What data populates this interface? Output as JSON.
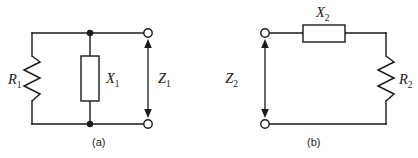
{
  "figure": {
    "background_color": "#ffffff",
    "line_color": "#1a1a1a",
    "width": 418,
    "height": 158
  },
  "circuit_a": {
    "caption": "(a)",
    "topology": "parallel",
    "components": [
      {
        "id": "r1",
        "label_base": "R",
        "label_sub": "1",
        "symbol": "zigzag-resistor",
        "orientation": "vertical",
        "label_side": "left"
      },
      {
        "id": "x1",
        "label_base": "X",
        "label_sub": "1",
        "symbol": "box-reactance",
        "orientation": "vertical",
        "label_side": "right"
      }
    ],
    "port": {
      "id": "z1",
      "label_base": "Z",
      "label_sub": "1",
      "symbol": "double-arrow",
      "orientation": "vertical",
      "label_side": "left"
    },
    "terminals": 2,
    "junctions": 2
  },
  "circuit_b": {
    "caption": "(b)",
    "topology": "series",
    "components": [
      {
        "id": "x2",
        "label_base": "X",
        "label_sub": "2",
        "symbol": "box-reactance",
        "orientation": "horizontal",
        "label_side": "above"
      },
      {
        "id": "r2",
        "label_base": "R",
        "label_sub": "2",
        "symbol": "zigzag-resistor",
        "orientation": "vertical",
        "label_side": "right"
      }
    ],
    "port": {
      "id": "z2",
      "label_base": "Z",
      "label_sub": "2",
      "symbol": "double-arrow",
      "orientation": "vertical",
      "label_side": "left"
    },
    "terminals": 2,
    "junctions": 0
  }
}
